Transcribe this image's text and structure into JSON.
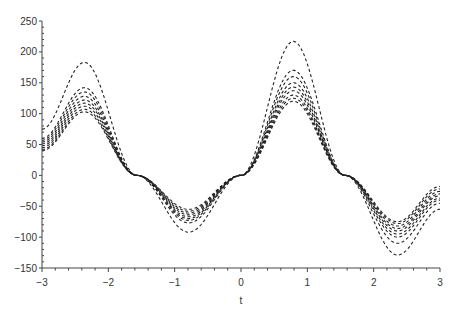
{
  "chart_data": {
    "type": "line",
    "title": "",
    "xlabel": "t",
    "ylabel": "",
    "xlim": [
      -3,
      3
    ],
    "ylim": [
      -150,
      250
    ],
    "grid": false,
    "legend": null,
    "line_style": "dashed",
    "line_color": "#222222",
    "x_ticks": [
      -3,
      -2,
      -1,
      0,
      1,
      2,
      3
    ],
    "y_ticks": [
      -150,
      -100,
      -50,
      0,
      50,
      100,
      150,
      200,
      250
    ],
    "x_key_points": [
      -3,
      -2.36,
      -1.57,
      -0.79,
      0,
      0.79,
      1.57,
      2.36,
      3
    ],
    "series": [
      {
        "name": "curve-1",
        "values": [
          75,
          183,
          0,
          -92,
          0,
          217,
          0,
          -129,
          -55
        ]
      },
      {
        "name": "curve-2",
        "values": [
          60,
          142,
          0,
          -77,
          0,
          170,
          0,
          -110,
          -45
        ]
      },
      {
        "name": "curve-3",
        "values": [
          57,
          135,
          0,
          -73,
          0,
          160,
          0,
          -100,
          -40
        ]
      },
      {
        "name": "curve-4",
        "values": [
          54,
          128,
          0,
          -70,
          0,
          150,
          0,
          -95,
          -37
        ]
      },
      {
        "name": "curve-5",
        "values": [
          51,
          122,
          0,
          -67,
          0,
          143,
          0,
          -90,
          -33
        ]
      },
      {
        "name": "curve-6",
        "values": [
          48,
          117,
          0,
          -64,
          0,
          137,
          0,
          -86,
          -30
        ]
      },
      {
        "name": "curve-7",
        "values": [
          45,
          112,
          0,
          -61,
          0,
          130,
          0,
          -82,
          -26
        ]
      },
      {
        "name": "curve-8",
        "values": [
          42,
          107,
          0,
          -58,
          0,
          125,
          0,
          -78,
          -22
        ]
      },
      {
        "name": "curve-9",
        "values": [
          40,
          103,
          0,
          -55,
          0,
          120,
          0,
          -75,
          -18
        ]
      }
    ]
  }
}
